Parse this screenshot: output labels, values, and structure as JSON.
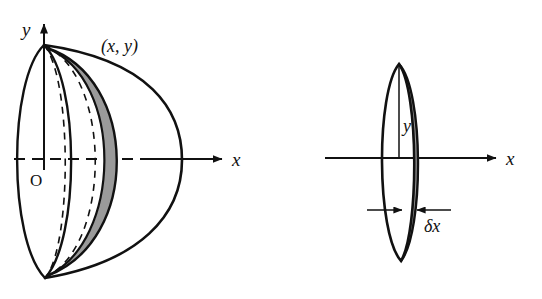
{
  "figure": {
    "background_color": "#ffffff",
    "stroke_color": "#111111",
    "shade_color": "#9a9a9a",
    "panels": [
      {
        "name": "hemisphere-panel",
        "labels": {
          "y_axis": "y",
          "x_axis": "x",
          "origin": "O",
          "point": "(x, y)"
        },
        "elements": [
          "y-axis-arrow",
          "x-axis-arrow",
          "dashed-x-axis-segment",
          "hemisphere-outline",
          "flat-face-ellipse",
          "hidden-rim-dashed-ellipse",
          "shaded-element-band"
        ]
      },
      {
        "name": "disc-panel",
        "labels": {
          "radius": "y",
          "x_axis": "x",
          "thickness": "δx"
        },
        "elements": [
          "x-axis-arrow",
          "disc-ellipse",
          "shaded-disc-edge",
          "radius-line",
          "thickness-dimension-arrows"
        ]
      }
    ]
  }
}
